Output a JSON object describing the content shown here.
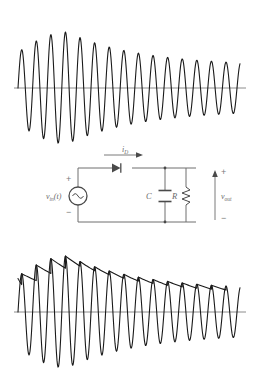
{
  "figure": {
    "background": "#ffffff",
    "width": 261,
    "height": 368,
    "trace_color": "#1a1a1a",
    "axis_color": "#8c8c8c",
    "wire_color": "#6e6e6e"
  },
  "panels": {
    "top": {
      "name": "input-waveform",
      "description": "Amplitude modulated carrier, decaying envelope",
      "axis_y": 88,
      "axis_x_start": 14,
      "axis_x_end": 246,
      "wave_x_start": 18,
      "wave_x_end": 240,
      "carrier_period_px": 14.6,
      "envelope_start_amplitude": 36,
      "envelope_peak_amplitude": 56,
      "envelope_end_amplitude": 22,
      "cycles": 15
    },
    "bottom": {
      "name": "output-waveform",
      "description": "Same carrier with capacitor peak-hold sawtooth envelope",
      "axis_y": 312,
      "axis_x_start": 14,
      "axis_x_end": 246,
      "wave_x_start": 18,
      "wave_x_end": 240,
      "carrier_period_px": 14.6,
      "envelope_start_amplitude": 36,
      "envelope_peak_amplitude": 56,
      "envelope_end_amplitude": 22,
      "ripple_droop": 0.82,
      "cycles": 15
    }
  },
  "circuit": {
    "name": "envelope-detector-circuit",
    "source_label": "v",
    "source_sub": "in",
    "source_arg": "(t)",
    "source_symbol": "sine-ac-source",
    "source_plus": "+",
    "source_minus": "−",
    "diode_current_label": "i",
    "diode_current_sub": "D",
    "diode_symbol": "diode",
    "capacitor_label": "C",
    "resistor_label": "R",
    "output_label": "v",
    "output_sub": "out",
    "output_plus": "+",
    "output_minus": "−",
    "geometry": {
      "left_x": 78,
      "right_x": 196,
      "cap_x": 165,
      "res_x": 186,
      "top_y": 168,
      "bottom_y": 222,
      "source_cy": 196,
      "source_r": 9,
      "diode_x": 122,
      "out_arrow_x": 215,
      "out_arrow_top": 172,
      "out_arrow_bottom": 220
    }
  }
}
